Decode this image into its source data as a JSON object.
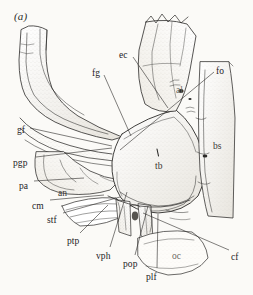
{
  "figure": {
    "panel_letter": "(a)",
    "background_color": "#fbfaf7",
    "ink_color": "#2b2a28",
    "width": 253,
    "height": 295,
    "caption_note": "Lateral view line drawing of a braincase / basicranium with lettered anatomical abbreviations and leader lines"
  },
  "labels": [
    {
      "id": "ec",
      "text": "ec",
      "x": 119,
      "y": 51,
      "anchor": "start",
      "style": "normal",
      "leader": [
        [
          133,
          57
        ],
        [
          168,
          108
        ]
      ]
    },
    {
      "id": "fg",
      "text": "fg",
      "x": 92,
      "y": 69,
      "anchor": "start",
      "style": "normal",
      "leader": [
        [
          104,
          75
        ],
        [
          131,
          136
        ]
      ]
    },
    {
      "id": "fo",
      "text": "fo",
      "x": 216,
      "y": 67,
      "anchor": "start",
      "style": "normal",
      "leader": [
        [
          214,
          72
        ],
        [
          120,
          150
        ]
      ]
    },
    {
      "id": "al",
      "text": "al",
      "x": 176,
      "y": 86,
      "anchor": "start",
      "style": "faint",
      "leader": null
    },
    {
      "id": "bs",
      "text": "bs",
      "x": 213,
      "y": 142,
      "anchor": "start",
      "style": "inner",
      "leader": null
    },
    {
      "id": "gf",
      "text": "gf",
      "x": 17,
      "y": 126,
      "anchor": "start",
      "style": "normal",
      "leader": [
        [
          30,
          128
        ],
        [
          112,
          146
        ]
      ]
    },
    {
      "id": "pgp",
      "text": "pgp",
      "x": 13,
      "y": 159,
      "anchor": "start",
      "style": "normal",
      "leader": [
        [
          36,
          157
        ],
        [
          112,
          148
        ]
      ]
    },
    {
      "id": "pa",
      "text": "pa",
      "x": 19,
      "y": 182,
      "anchor": "start",
      "style": "normal",
      "leader": [
        [
          34,
          181
        ],
        [
          84,
          178
        ]
      ]
    },
    {
      "id": "an",
      "text": "an",
      "x": 58,
      "y": 189,
      "anchor": "start",
      "style": "inner",
      "leader": null
    },
    {
      "id": "cm",
      "text": "cm",
      "x": 32,
      "y": 202,
      "anchor": "start",
      "style": "normal",
      "leader": [
        [
          50,
          200
        ],
        [
          104,
          195
        ]
      ]
    },
    {
      "id": "stf",
      "text": "stf",
      "x": 47,
      "y": 216,
      "anchor": "start",
      "style": "normal",
      "leader": [
        [
          63,
          213
        ],
        [
          120,
          197
        ]
      ]
    },
    {
      "id": "tb",
      "text": "tb",
      "x": 155,
      "y": 162,
      "anchor": "start",
      "style": "inner",
      "leader": null
    },
    {
      "id": "ptp",
      "text": "ptp",
      "x": 67,
      "y": 237,
      "anchor": "start",
      "style": "normal",
      "leader": [
        [
          80,
          233
        ],
        [
          108,
          205
        ]
      ]
    },
    {
      "id": "vph",
      "text": "vph",
      "x": 96,
      "y": 252,
      "anchor": "start",
      "style": "normal",
      "leader": [
        [
          110,
          247
        ],
        [
          127,
          192
        ]
      ]
    },
    {
      "id": "pop",
      "text": "pop",
      "x": 123,
      "y": 260,
      "anchor": "start",
      "style": "normal",
      "leader": [
        [
          135,
          255
        ],
        [
          148,
          206
        ]
      ]
    },
    {
      "id": "plf",
      "text": "plf",
      "x": 146,
      "y": 273,
      "anchor": "start",
      "style": "normal",
      "leader": [
        [
          157,
          268
        ],
        [
          158,
          214
        ]
      ]
    },
    {
      "id": "oc",
      "text": "oc",
      "x": 172,
      "y": 252,
      "anchor": "start",
      "style": "faint",
      "leader": null
    },
    {
      "id": "cf",
      "text": "cf",
      "x": 231,
      "y": 253,
      "anchor": "start",
      "style": "normal",
      "leader": [
        [
          229,
          250
        ],
        [
          143,
          213
        ]
      ]
    }
  ],
  "drawing": {
    "note": "Pen-and-ink stipple rendering of cranial elements",
    "outlines": [
      {
        "name": "upper-left-process",
        "d": "M22 31 L20 84 Q24 100 36 110 Q52 122 78 128 Q100 133 120 137 L124 133 Q103 124 86 112 Q70 100 60 84 Q52 70 50 52 L50 32 Q40 26 30 27 Z"
      },
      {
        "name": "upper-left-process-inner",
        "d": "M28 38 L27 80 Q32 95 45 105 Q60 114 82 121"
      },
      {
        "name": "upper-left-process-inner2",
        "d": "M44 34 L44 52 Q46 70 58 86 Q70 100 90 110"
      },
      {
        "name": "glenoid-band",
        "d": "M22 128 Q50 142 82 148 Q106 152 122 152"
      },
      {
        "name": "glenoid-band2",
        "d": "M24 136 Q52 150 84 156 Q106 160 120 160"
      },
      {
        "name": "mid-left-block",
        "d": "M38 152 Q36 170 44 182 Q56 193 76 194 Q96 194 112 188 L118 178 Q104 176 92 170 Q78 162 70 152 Z"
      },
      {
        "name": "central-dome",
        "d": "M122 136 Q150 118 178 112 Q196 126 204 150 Q210 176 200 196 Q186 212 160 214 Q136 214 122 200 Q112 184 112 164 Q114 148 122 136 Z"
      },
      {
        "name": "upper-right-element",
        "d": "M150 24 L142 58 Q140 90 150 110 L178 112 Q186 96 190 74 L196 38 L186 26 Q168 20 150 24 Z"
      },
      {
        "name": "right-strip",
        "d": "M200 66 L198 132 Q200 180 206 212 L232 216 L234 120 Q232 84 228 66 Z"
      },
      {
        "name": "lower-occipital",
        "d": "M140 236 Q162 228 192 232 Q206 240 208 258 Q196 274 168 274 Q148 270 140 256 Z"
      },
      {
        "name": "pterygoid-plate",
        "d": "M66 206 Q92 198 116 200 L128 214 Q108 226 82 226 Q70 218 66 206 Z"
      },
      {
        "name": "ventral-process-a",
        "d": "M118 206 L122 234 L134 236 L132 206 Z"
      },
      {
        "name": "ventral-process-b",
        "d": "M140 208 L142 238 L154 240 L152 208 Z"
      }
    ]
  }
}
